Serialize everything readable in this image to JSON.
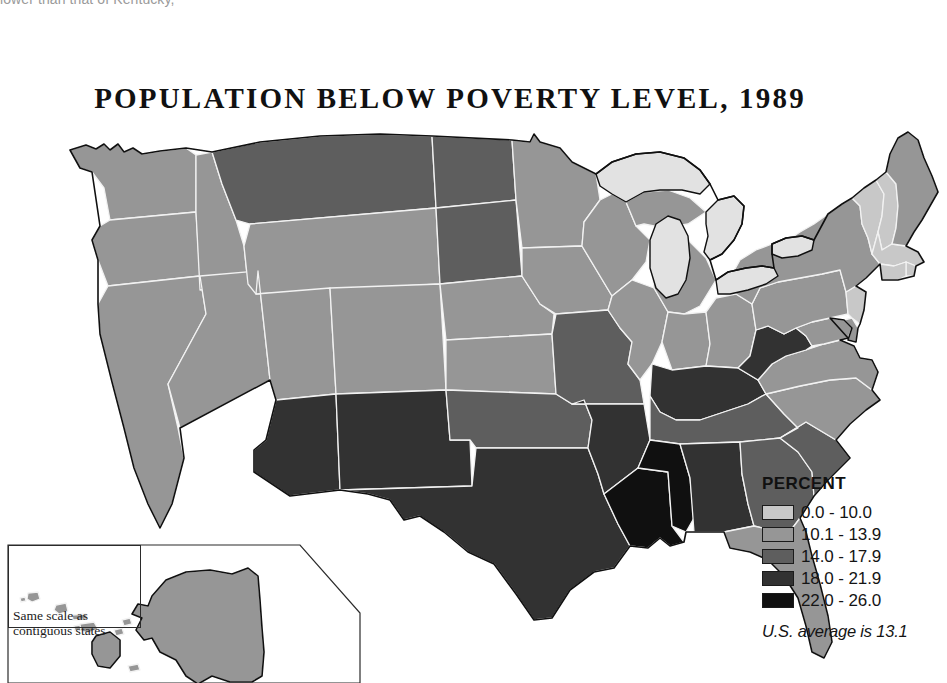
{
  "page": {
    "cropped_text_above": "lower than that of Kentucky,"
  },
  "map": {
    "title": "POPULATION BELOW POVERTY LEVEL, 1989",
    "inset_note_line1": "Same scale as",
    "inset_note_line2": "contiguous states"
  },
  "legend": {
    "title": "PERCENT",
    "note": "U.S. average is 13.1",
    "classes": [
      {
        "label": "0.0 - 10.0",
        "color": "#c8c8c8",
        "min": 0.0,
        "max": 10.0
      },
      {
        "label": "10.1 - 13.9",
        "color": "#969696",
        "min": 10.1,
        "max": 13.9
      },
      {
        "label": "14.0 - 17.9",
        "color": "#5e5e5e",
        "min": 14.0,
        "max": 17.9
      },
      {
        "label": "18.0 - 21.9",
        "color": "#323232",
        "min": 18.0,
        "max": 21.9
      },
      {
        "label": "22.0 - 26.0",
        "color": "#101010",
        "min": 22.0,
        "max": 26.0
      }
    ]
  },
  "chart_data": {
    "type": "map",
    "title": "POPULATION BELOW POVERTY LEVEL, 1989",
    "subtitle": "",
    "measure": "Percent of population below poverty level",
    "unit": "percent",
    "year": 1989,
    "national_average": 13.1,
    "legend_position": "right",
    "color_scale": [
      "#c8c8c8",
      "#969696",
      "#5e5e5e",
      "#323232",
      "#101010"
    ],
    "class_breaks": [
      "0.0 - 10.0",
      "10.1 - 13.9",
      "14.0 - 17.9",
      "18.0 - 21.9",
      "22.0 - 26.0"
    ],
    "regions": [
      {
        "name": "Washington",
        "abbr": "WA",
        "class": 1
      },
      {
        "name": "Oregon",
        "abbr": "OR",
        "class": 1
      },
      {
        "name": "California",
        "abbr": "CA",
        "class": 1
      },
      {
        "name": "Idaho",
        "abbr": "ID",
        "class": 1
      },
      {
        "name": "Nevada",
        "abbr": "NV",
        "class": 1
      },
      {
        "name": "Montana",
        "abbr": "MT",
        "class": 2
      },
      {
        "name": "Wyoming",
        "abbr": "WY",
        "class": 1
      },
      {
        "name": "Utah",
        "abbr": "UT",
        "class": 1
      },
      {
        "name": "Colorado",
        "abbr": "CO",
        "class": 1
      },
      {
        "name": "Arizona",
        "abbr": "AZ",
        "class": 3
      },
      {
        "name": "New Mexico",
        "abbr": "NM",
        "class": 3
      },
      {
        "name": "North Dakota",
        "abbr": "ND",
        "class": 2
      },
      {
        "name": "South Dakota",
        "abbr": "SD",
        "class": 2
      },
      {
        "name": "Nebraska",
        "abbr": "NE",
        "class": 1
      },
      {
        "name": "Kansas",
        "abbr": "KS",
        "class": 1
      },
      {
        "name": "Oklahoma",
        "abbr": "OK",
        "class": 2
      },
      {
        "name": "Texas",
        "abbr": "TX",
        "class": 3
      },
      {
        "name": "Minnesota",
        "abbr": "MN",
        "class": 1
      },
      {
        "name": "Iowa",
        "abbr": "IA",
        "class": 1
      },
      {
        "name": "Missouri",
        "abbr": "MO",
        "class": 2
      },
      {
        "name": "Arkansas",
        "abbr": "AR",
        "class": 3
      },
      {
        "name": "Louisiana",
        "abbr": "LA",
        "class": 4
      },
      {
        "name": "Wisconsin",
        "abbr": "WI",
        "class": 1
      },
      {
        "name": "Illinois",
        "abbr": "IL",
        "class": 1
      },
      {
        "name": "Michigan",
        "abbr": "MI",
        "class": 1
      },
      {
        "name": "Indiana",
        "abbr": "IN",
        "class": 1
      },
      {
        "name": "Ohio",
        "abbr": "OH",
        "class": 1
      },
      {
        "name": "Kentucky",
        "abbr": "KY",
        "class": 3
      },
      {
        "name": "Tennessee",
        "abbr": "TN",
        "class": 2
      },
      {
        "name": "Mississippi",
        "abbr": "MS",
        "class": 4
      },
      {
        "name": "Alabama",
        "abbr": "AL",
        "class": 3
      },
      {
        "name": "Georgia",
        "abbr": "GA",
        "class": 2
      },
      {
        "name": "Florida",
        "abbr": "FL",
        "class": 1
      },
      {
        "name": "South Carolina",
        "abbr": "SC",
        "class": 2
      },
      {
        "name": "North Carolina",
        "abbr": "NC",
        "class": 1
      },
      {
        "name": "Virginia",
        "abbr": "VA",
        "class": 1
      },
      {
        "name": "West Virginia",
        "abbr": "WV",
        "class": 3
      },
      {
        "name": "Maryland",
        "abbr": "MD",
        "class": 1
      },
      {
        "name": "Delaware",
        "abbr": "DE",
        "class": 1
      },
      {
        "name": "Pennsylvania",
        "abbr": "PA",
        "class": 1
      },
      {
        "name": "New Jersey",
        "abbr": "NJ",
        "class": 0
      },
      {
        "name": "New York",
        "abbr": "NY",
        "class": 1
      },
      {
        "name": "Connecticut",
        "abbr": "CT",
        "class": 0
      },
      {
        "name": "Rhode Island",
        "abbr": "RI",
        "class": 0
      },
      {
        "name": "Massachusetts",
        "abbr": "MA",
        "class": 0
      },
      {
        "name": "Vermont",
        "abbr": "VT",
        "class": 0
      },
      {
        "name": "New Hampshire",
        "abbr": "NH",
        "class": 0
      },
      {
        "name": "Maine",
        "abbr": "ME",
        "class": 1
      },
      {
        "name": "Alaska",
        "abbr": "AK",
        "class": 1
      },
      {
        "name": "Hawaii",
        "abbr": "HI",
        "class": 1
      }
    ],
    "water_features": [
      "Lake Superior",
      "Lake Michigan",
      "Lake Huron",
      "Lake Erie",
      "Lake Ontario"
    ]
  }
}
